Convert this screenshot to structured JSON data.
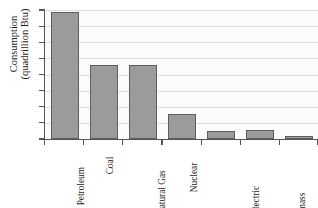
{
  "chart_data": {
    "type": "bar",
    "title": "",
    "xlabel": "",
    "ylabel": "Consumption (quadrillion Btu)",
    "ylabel_lines": [
      "Consumption",
      "(quadrillion Btu)"
    ],
    "ylim": [
      0,
      40
    ],
    "ytick_step": 5,
    "yticks": [
      "0",
      "5",
      "10",
      "15",
      "20",
      "25",
      "30",
      "35",
      "40"
    ],
    "grid": "horizontal",
    "legend": "none",
    "categories": [
      "Petroleum",
      "Coal",
      "Natural Gas",
      "Nuclear",
      "Hydroelectric Power",
      "Biomass (such as wood)",
      "Other (including geothermal, wind, and solar)"
    ],
    "category_label_lines": [
      [
        "Petroleum"
      ],
      [
        "Coal"
      ],
      [
        "Natural Gas"
      ],
      [
        "Nuclear"
      ],
      [
        "Hydroelectric",
        "Power"
      ],
      [
        "Biomass",
        "(such as wood)"
      ],
      [
        "Other (including",
        "geothermal,",
        "wind, and solar)"
      ]
    ],
    "values": [
      39.5,
      22.8,
      22.8,
      7.8,
      2.4,
      2.8,
      0.9
    ],
    "colors": {
      "bar_fill": "#9b9b9b",
      "bar_border": "#5e5e5e",
      "axis": "#55565a",
      "gridline": "#dcdcdc",
      "plot_background": "#fbfbfb",
      "text": "#1a1a1a"
    }
  }
}
